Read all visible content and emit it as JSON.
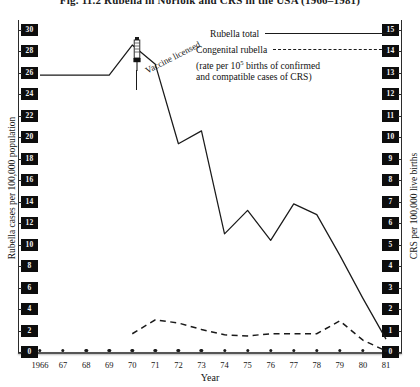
{
  "figure": {
    "title": "Fig. 11.2  Rubella in Norfolk and CRS in the USA (1966–1981)"
  },
  "axes": {
    "y_left_title": "Rubella cases per 100,000 population",
    "y_right_title": "CRS per 100,000 live births",
    "x_title": "Year"
  },
  "legend": {
    "rubella_label": "Rubella total",
    "crs_label": "Congenital rubella",
    "crs_sub_line1_a": "(rate per 10",
    "crs_sub_line1_sup": "5",
    "crs_sub_line1_b": " births of confirmed",
    "crs_sub_line2": "and compatible cases of CRS)"
  },
  "annotation": {
    "vaccine_label": "Vaccine licensed",
    "icon": "syringe-icon"
  },
  "chart_data": {
    "type": "line",
    "title": "Fig. 11.2  Rubella in Norfolk and CRS in the USA (1966–1981)",
    "xlabel": "Year",
    "ylabel": "Rubella cases per 100,000 population",
    "y2label": "CRS per 100,000 live births",
    "grid": false,
    "legend_position": "top-right",
    "x": [
      1966,
      1967,
      1968,
      1969,
      1970,
      1971,
      1972,
      1973,
      1974,
      1975,
      1976,
      1977,
      1978,
      1979,
      1980,
      1981
    ],
    "xtick_labels": [
      "1966",
      "67",
      "68",
      "69",
      "70",
      "71",
      "72",
      "73",
      "74",
      "75",
      "76",
      "77",
      "78",
      "79",
      "80",
      "81"
    ],
    "ylim": [
      0,
      30
    ],
    "ytick_labels": [
      "0",
      "2",
      "4",
      "6",
      "8",
      "10",
      "12",
      "14",
      "16",
      "18",
      "20",
      "22",
      "24",
      "26",
      "28",
      "30"
    ],
    "y2lim": [
      0,
      15
    ],
    "y2tick_labels": [
      "0",
      "1",
      "2",
      "3",
      "4",
      "5",
      "6",
      "7",
      "8",
      "9",
      "10",
      "11",
      "12",
      "13",
      "14",
      "15"
    ],
    "series": [
      {
        "name": "Rubella total",
        "axis": "left",
        "style": "solid",
        "values": [
          25.8,
          25.8,
          25.8,
          25.8,
          28.6,
          26.8,
          19.4,
          20.6,
          11.0,
          13.2,
          10.4,
          13.8,
          12.8,
          9.0,
          5.0,
          1.2
        ]
      },
      {
        "name": "Congenital rubella",
        "axis": "right",
        "style": "dashed",
        "values": [
          null,
          null,
          null,
          null,
          0.85,
          1.5,
          1.35,
          1.05,
          0.8,
          0.75,
          0.85,
          0.85,
          0.85,
          1.45,
          0.55,
          0.05
        ]
      }
    ],
    "annotations": [
      {
        "text": "Vaccine licensed",
        "x": 1970,
        "note": "arrow points to 1970 peak"
      }
    ]
  }
}
